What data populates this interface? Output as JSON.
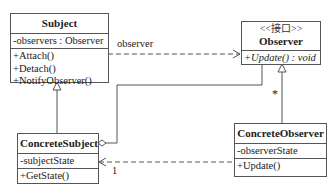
{
  "diagram": {
    "type": "uml-class-diagram",
    "classes": {
      "subject": {
        "name": "Subject",
        "attributes": [
          "-observers : Observer"
        ],
        "methods": [
          "+Attach()",
          "+Detach()",
          "+NotifyObserver()"
        ]
      },
      "observer": {
        "stereotype": "<<接口>>",
        "name": "Observer",
        "methods": [
          "+Update() : void"
        ]
      },
      "concrete_subject": {
        "name": "ConcreteSubject",
        "attributes": [
          "-subjectState"
        ],
        "methods": [
          "+GetState()"
        ]
      },
      "concrete_observer": {
        "name": "ConcreteObserver",
        "attributes": [
          "-observerState"
        ],
        "methods": [
          "+Update()"
        ]
      }
    },
    "relations": {
      "subject_observer": {
        "label": "observer",
        "kind": "dependency"
      },
      "observer_multiplicity": {
        "label": "*"
      },
      "concrete_observer_subject": {
        "label": "1",
        "kind": "dependency"
      }
    },
    "colors": {
      "line": "#555555",
      "background": "#ffffff",
      "text": "#222222"
    }
  }
}
